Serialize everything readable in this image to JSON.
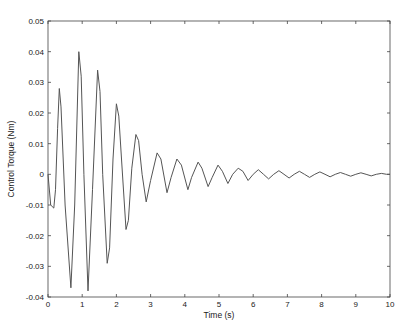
{
  "chart_data": {
    "type": "line",
    "title": "",
    "xlabel": "Time (s)",
    "ylabel": "Control Torque (Nm)",
    "xlim": [
      0,
      10
    ],
    "ylim": [
      -0.04,
      0.05
    ],
    "xticks": [
      0,
      1,
      2,
      3,
      4,
      5,
      6,
      7,
      8,
      9,
      10
    ],
    "yticks": [
      -0.04,
      -0.03,
      -0.02,
      -0.01,
      0,
      0.01,
      0.02,
      0.03,
      0.04,
      0.05
    ],
    "ytick_labels": [
      "-0.04",
      "-0.03",
      "-0.02",
      "-0.01",
      "0",
      "0.01",
      "0.02",
      "0.03",
      "0.04",
      "0.05"
    ],
    "grid": false,
    "legend": null,
    "line_color": "#555555",
    "series": [
      {
        "name": "Control Torque",
        "x": [
          0,
          0.08,
          0.17,
          0.22,
          0.28,
          0.33,
          0.38,
          0.5,
          0.67,
          0.78,
          0.9,
          0.97,
          1.05,
          1.17,
          1.3,
          1.45,
          1.52,
          1.6,
          1.73,
          1.8,
          1.9,
          2.0,
          2.07,
          2.15,
          2.28,
          2.35,
          2.45,
          2.57,
          2.65,
          2.75,
          2.87,
          3.0,
          3.19,
          3.3,
          3.48,
          3.6,
          3.77,
          3.9,
          4.09,
          4.2,
          4.39,
          4.5,
          4.68,
          4.8,
          4.97,
          5.1,
          5.26,
          5.4,
          5.56,
          5.7,
          5.85,
          6.0,
          6.15,
          6.3,
          6.45,
          6.6,
          6.75,
          6.9,
          7.05,
          7.2,
          7.35,
          7.5,
          7.65,
          7.8,
          7.95,
          8.1,
          8.25,
          8.4,
          8.55,
          8.7,
          8.85,
          9.0,
          9.15,
          9.3,
          9.45,
          9.6,
          9.75,
          9.9,
          10.0
        ],
        "y": [
          0.0,
          -0.01,
          -0.011,
          -0.005,
          0.015,
          0.028,
          0.022,
          -0.01,
          -0.037,
          -0.01,
          0.04,
          0.032,
          0.0,
          -0.038,
          -0.005,
          0.034,
          0.027,
          0.0,
          -0.029,
          -0.024,
          0.005,
          0.023,
          0.019,
          0.005,
          -0.018,
          -0.015,
          0.002,
          0.013,
          0.011,
          0.0,
          -0.009,
          -0.002,
          0.007,
          0.005,
          -0.006,
          -0.001,
          0.005,
          0.003,
          -0.005,
          -0.001,
          0.004,
          0.002,
          -0.004,
          -0.001,
          0.003,
          0.001,
          -0.003,
          0.0,
          0.002,
          0.001,
          -0.002,
          0.0,
          0.0015,
          0.0,
          -0.0015,
          0.0,
          0.0012,
          0.0,
          -0.0012,
          0.0,
          0.001,
          0.0,
          -0.001,
          0.0,
          0.0008,
          0.0,
          -0.0008,
          0.0,
          0.0006,
          0.0,
          -0.0006,
          0.0,
          0.0005,
          0.0,
          -0.0005,
          0.0,
          0.0003,
          0.0,
          0.0
        ]
      }
    ]
  }
}
